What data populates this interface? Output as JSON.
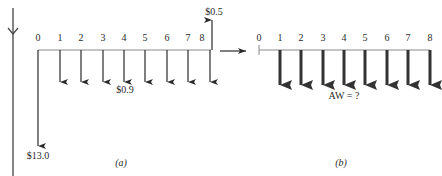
{
  "diagram_a": {
    "caption": "(a)",
    "periods": [
      "0",
      "1",
      "2",
      "3",
      "4",
      "5",
      "6",
      "7",
      "8"
    ],
    "initial_cost_label": "$13.0",
    "annual_cost_label": "$0.9",
    "salvage_label": "$0.5"
  },
  "diagram_b": {
    "caption": "(b)",
    "periods": [
      "0",
      "1",
      "2",
      "3",
      "4",
      "5",
      "6",
      "7",
      "8"
    ],
    "aw_label": "AW = ?"
  },
  "colors": {
    "line": "#2a2a2a",
    "axis": "#8a8a8a"
  }
}
